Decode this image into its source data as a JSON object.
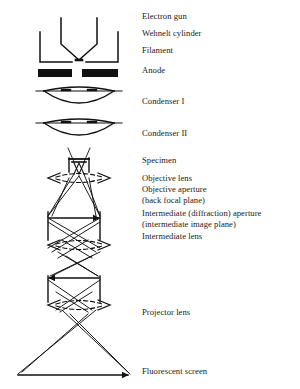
{
  "diagram": {
    "stroke_color": "#111111",
    "background_color": "#ffffff",
    "text_color": "#1a1a1a",
    "labels": [
      {
        "id": "electron-gun",
        "text": "Electron gun",
        "x": 142,
        "y": 16
      },
      {
        "id": "wehnelt-cylinder",
        "text": "Wehnelt cylinder",
        "x": 142,
        "y": 33
      },
      {
        "id": "filament",
        "text": "Filament",
        "x": 142,
        "y": 50
      },
      {
        "id": "anode",
        "text": "Anode",
        "x": 142,
        "y": 70
      },
      {
        "id": "condenser-1",
        "text": "Condenser I",
        "x": 142,
        "y": 101
      },
      {
        "id": "condenser-2",
        "text": "Condenser II",
        "x": 142,
        "y": 133
      },
      {
        "id": "specimen",
        "text": "Specimen",
        "x": 142,
        "y": 160
      },
      {
        "id": "objective-lens",
        "text": "Objective lens",
        "x": 142,
        "y": 178
      },
      {
        "id": "objective-aperture",
        "text": "Objective aperture",
        "x": 142,
        "y": 189
      },
      {
        "id": "back-focal-plane",
        "text": "(back focal plane)",
        "x": 142,
        "y": 200
      },
      {
        "id": "intermediate-aperture",
        "text": "Intermediate (diffraction) aperture",
        "x": 142,
        "y": 213
      },
      {
        "id": "intermediate-image-plane",
        "text": "(intermediate image plane)",
        "x": 142,
        "y": 224
      },
      {
        "id": "intermediate-lens",
        "text": "Intermediate lens",
        "x": 142,
        "y": 236
      },
      {
        "id": "projector-lens",
        "text": "Projector lens",
        "x": 142,
        "y": 312
      },
      {
        "id": "fluorescent-screen",
        "text": "Fluorescent screen",
        "x": 142,
        "y": 371
      }
    ],
    "components": [
      {
        "id": "filament-v",
        "name": "Filament",
        "type": "v-shape",
        "apex_y": 58
      },
      {
        "id": "wehnelt-u",
        "name": "Wehnelt cylinder",
        "type": "u-shape",
        "y_top": 32,
        "y_bottom": 62
      },
      {
        "id": "anode-left-bar",
        "name": "Anode (left)",
        "type": "filled-bar",
        "x": 38,
        "y": 69,
        "width": 34,
        "height": 8
      },
      {
        "id": "anode-right-bar",
        "name": "Anode (right)",
        "type": "filled-bar",
        "x": 82,
        "y": 69,
        "width": 36,
        "height": 8
      },
      {
        "id": "condenser-1-lens",
        "name": "Condenser I",
        "type": "lens",
        "cy": 97
      },
      {
        "id": "condenser-2-lens",
        "name": "Condenser II",
        "type": "lens",
        "cy": 129
      },
      {
        "id": "specimen-holder",
        "name": "Specimen holder",
        "type": "box",
        "cy": 166
      },
      {
        "id": "objective-lens-ellipse",
        "name": "Objective lens",
        "type": "dashed-ellipse",
        "cy": 178
      },
      {
        "id": "back-focal-plane-line",
        "name": "Back focal plane",
        "type": "aperture-plane",
        "cy": 218
      },
      {
        "id": "intermediate-lens-ellipse",
        "name": "Intermediate lens",
        "type": "dashed-ellipse",
        "cy": 245
      },
      {
        "id": "intermediate-image-line",
        "name": "Intermediate image plane",
        "type": "aperture-plane",
        "cy": 278
      },
      {
        "id": "projector-lens-ellipse",
        "name": "Projector lens",
        "type": "dashed-ellipse",
        "cy": 305
      },
      {
        "id": "fluorescent-screen-line",
        "name": "Fluorescent screen",
        "type": "screen-plane",
        "cy": 375
      }
    ]
  }
}
